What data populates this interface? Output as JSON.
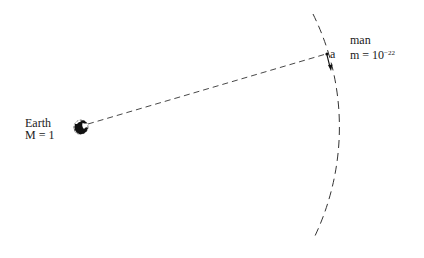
{
  "earth": {
    "name": "Earth",
    "mass_label": "M = 1"
  },
  "man": {
    "name": "man",
    "mass_label_base": "m = 10",
    "mass_exponent": "−22",
    "point_label": "a"
  },
  "colors": {
    "ink": "#1a1a1a",
    "background": "#ffffff"
  }
}
